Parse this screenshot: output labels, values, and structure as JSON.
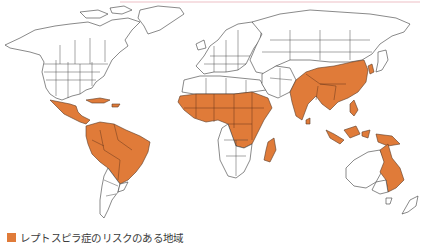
{
  "map": {
    "type": "world-choropleth",
    "projection": "equirectangular-like",
    "risk_color": "#e07b39",
    "land_color": "#ffffff",
    "outline_color": "#3a3a3a",
    "highlighted_regions": [
      "Mexico (southern)",
      "Central America",
      "Caribbean",
      "Northern & central South America (Brazil, Colombia, Venezuela, Guianas, Peru, Bolivia, Paraguay, Ecuador)",
      "Sub-Saharan Africa",
      "Madagascar",
      "South Asia (India, Pakistan, Nepal, Bangladesh, Sri Lanka)",
      "China (eastern & southern)",
      "Korea",
      "Southeast Asia",
      "Indonesia",
      "Philippines",
      "Papua New Guinea",
      "Northeastern Australia"
    ]
  },
  "legend": {
    "swatch_color": "#e07b39",
    "label": "レプトスピラ症のリスクのある地域"
  }
}
